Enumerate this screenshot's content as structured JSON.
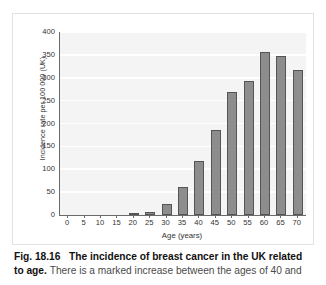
{
  "chart_data": {
    "type": "bar",
    "title": "The incidence of breast cancer in the UK related to age",
    "xlabel": "Age (years)",
    "ylabel": "Incidence rate per 100 000 (UK)",
    "categories": [
      "0",
      "5",
      "10",
      "15",
      "20",
      "25",
      "30",
      "35",
      "40",
      "45",
      "50",
      "55",
      "60",
      "65",
      "70"
    ],
    "values": [
      0,
      0,
      0,
      0,
      3,
      7,
      25,
      62,
      119,
      186,
      268,
      292,
      357,
      347,
      317
    ],
    "xlim": [
      -2.5,
      72.5
    ],
    "ylim": [
      0,
      400
    ],
    "yticks": [
      0,
      50,
      100,
      150,
      200,
      250,
      300,
      350,
      400
    ],
    "xticks": [
      0,
      5,
      10,
      15,
      20,
      25,
      30,
      35,
      40,
      45,
      50,
      55,
      60,
      65,
      70
    ],
    "grid": "horizontal",
    "legend": "none",
    "bar_color": "#8d8d8d",
    "bar_edge_color": "#555555",
    "plot_background": "#f4f4f4",
    "gridline_color": "#ffffff",
    "axis_color": "#6a6a6a"
  },
  "caption": {
    "figure_number": "Fig. 18.16",
    "title": "The incidence of breast cancer in the UK related to age.",
    "body": "There is a marked increase between the ages of 40 and"
  }
}
